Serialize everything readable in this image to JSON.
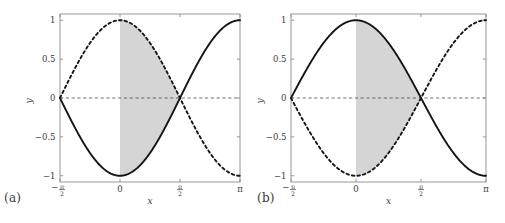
{
  "figure": {
    "width": 505,
    "height": 223,
    "background": "#ffffff",
    "shade_color": "#d5d5d5",
    "curve_color": "#151515",
    "axis_color": "#8d8d8d",
    "text_color": "#3b3b3b"
  },
  "panels": [
    {
      "tag": "(a)",
      "name": "panel-a",
      "xlabel": "x",
      "ylabel": "y",
      "xticks": [
        {
          "value": -1.5707963,
          "label": "-",
          "num": "π",
          "den": "2",
          "kind": "frac-neg"
        },
        {
          "value": 0,
          "label": "0",
          "kind": "plain"
        },
        {
          "value": 1.5707963,
          "label": "",
          "num": "π",
          "den": "2",
          "kind": "frac"
        },
        {
          "value": 3.1415927,
          "label": "π",
          "kind": "plain"
        }
      ],
      "yticks": [
        {
          "value": 1,
          "label": "1"
        },
        {
          "value": 0.5,
          "label": "0.5"
        },
        {
          "value": 0,
          "label": "0"
        },
        {
          "value": -0.5,
          "label": "−0.5"
        },
        {
          "value": -1,
          "label": "−1"
        }
      ]
    },
    {
      "tag": "(b)",
      "name": "panel-b",
      "xlabel": "x",
      "ylabel": "y",
      "xticks": [
        {
          "value": -1.5707963,
          "label": "-",
          "num": "π",
          "den": "2",
          "kind": "frac-neg"
        },
        {
          "value": 0,
          "label": "0",
          "kind": "plain"
        },
        {
          "value": 1.5707963,
          "label": "",
          "num": "π",
          "den": "2",
          "kind": "frac"
        },
        {
          "value": 3.1415927,
          "label": "π",
          "kind": "plain"
        }
      ],
      "yticks": [
        {
          "value": 1,
          "label": "1"
        },
        {
          "value": 0.5,
          "label": "0.5"
        },
        {
          "value": 0,
          "label": "0"
        },
        {
          "value": -0.5,
          "label": "−0.5"
        },
        {
          "value": -1,
          "label": "−1"
        }
      ]
    }
  ],
  "chart_data": [
    {
      "type": "line",
      "title": "(a)",
      "xlabel": "x",
      "ylabel": "y",
      "xlim": [
        -1.5707963,
        3.1415927
      ],
      "ylim": [
        -1.08,
        1.08
      ],
      "grid": false,
      "legend": "none",
      "zero_line": {
        "value": 0,
        "style": "dashed",
        "color": "#333333"
      },
      "shaded_region": {
        "x_from": 0,
        "x_to": 1.5707963,
        "bounded_below": "min(curve1, curve2)",
        "bounded_above": "max(curve1, curve2)",
        "color": "#d5d5d5",
        "note": "region between the two curves over [0, pi/2]"
      },
      "series": [
        {
          "name": "solid",
          "style": "solid",
          "formula": "-cos(x)",
          "x": [
            -1.5707963,
            -1.178097,
            -0.7853982,
            -0.3926991,
            0,
            0.3926991,
            0.7853982,
            1.178097,
            1.5707963,
            1.9634954,
            2.3561945,
            2.7488936,
            3.1415927
          ],
          "values": [
            -1.0,
            -0.9239,
            -0.7071,
            -0.3827,
            0.0,
            0.3827,
            0.7071,
            0.9239,
            1.0,
            0.9239,
            0.7071,
            0.3827,
            0.0
          ]
        },
        {
          "name": "dashed",
          "style": "dashed",
          "formula": "cos(x)",
          "x": [
            -1.5707963,
            -1.178097,
            -0.7853982,
            -0.3926991,
            0,
            0.3926991,
            0.7853982,
            1.178097,
            1.5707963,
            1.9634954,
            2.3561945,
            2.7488936,
            3.1415927
          ],
          "values": [
            0.0,
            0.3827,
            0.7071,
            0.9239,
            1.0,
            0.9239,
            0.7071,
            0.3827,
            0.0,
            -0.3827,
            -0.7071,
            -0.9239,
            -1.0
          ]
        }
      ]
    },
    {
      "type": "line",
      "title": "(b)",
      "xlabel": "x",
      "ylabel": "y",
      "xlim": [
        -1.5707963,
        3.1415927
      ],
      "ylim": [
        -1.08,
        1.08
      ],
      "grid": false,
      "legend": "none",
      "zero_line": {
        "value": 0,
        "style": "dashed",
        "color": "#333333"
      },
      "shaded_region": {
        "x_from": 0,
        "x_to": 1.5707963,
        "bounded_below": "min(curve1, curve2)",
        "bounded_above": "max(curve1, curve2)",
        "color": "#d5d5d5",
        "note": "region between the two curves over [0, pi/2], lying below y=0"
      },
      "series": [
        {
          "name": "solid",
          "style": "solid",
          "formula": "cos(x)",
          "x": [
            -1.5707963,
            -1.178097,
            -0.7853982,
            -0.3926991,
            0,
            0.3926991,
            0.7853982,
            1.178097,
            1.5707963,
            1.9634954,
            2.3561945,
            2.7488936,
            3.1415927
          ],
          "values": [
            0.0,
            0.3827,
            0.7071,
            0.9239,
            1.0,
            0.9239,
            0.7071,
            0.3827,
            0.0,
            -0.3827,
            -0.7071,
            -0.9239,
            -1.0
          ]
        },
        {
          "name": "dashed",
          "style": "dashed",
          "formula": "-cos(x)",
          "x": [
            -1.5707963,
            -1.178097,
            -0.7853982,
            -0.3926991,
            0,
            0.3926991,
            0.7853982,
            1.178097,
            1.5707963,
            1.9634954,
            2.3561945,
            2.7488936,
            3.1415927
          ],
          "values": [
            -1.0,
            -0.9239,
            -0.7071,
            -0.3827,
            0.0,
            0.3827,
            0.7071,
            0.9239,
            1.0,
            0.9239,
            0.7071,
            0.3827,
            0.0
          ]
        }
      ]
    }
  ]
}
